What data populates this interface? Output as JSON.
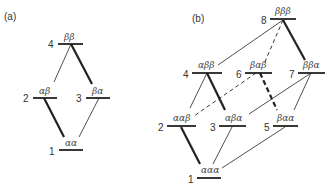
{
  "panel_a": {
    "label": "(a)",
    "levels": [
      {
        "n": "4",
        "state": "ββ"
      },
      {
        "n": "2",
        "state": "αβ"
      },
      {
        "n": "3",
        "state": "βα"
      },
      {
        "n": "1",
        "state": "αα"
      }
    ]
  },
  "panel_b": {
    "label": "(b)",
    "levels": [
      {
        "n": "8",
        "state": "βββ"
      },
      {
        "n": "4",
        "state": "αββ"
      },
      {
        "n": "6",
        "state": "βαβ"
      },
      {
        "n": "7",
        "state": "ββα"
      },
      {
        "n": "2",
        "state": "ααβ"
      },
      {
        "n": "3",
        "state": "αβα"
      },
      {
        "n": "5",
        "state": "βαα"
      },
      {
        "n": "1",
        "state": "ααα"
      }
    ]
  },
  "colors": {
    "line": "#222222",
    "text": "#333333"
  }
}
